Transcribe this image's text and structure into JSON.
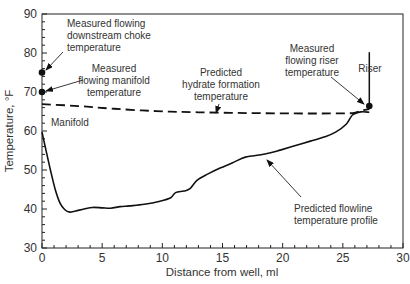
{
  "chart_data": {
    "type": "line",
    "title": "",
    "xlabel": "Distance from well, ml",
    "ylabel": "Temperature, °F",
    "xlim": [
      0,
      30
    ],
    "ylim": [
      30,
      90
    ],
    "xticks": [
      0,
      5,
      10,
      15,
      20,
      25,
      30
    ],
    "yticks": [
      30,
      40,
      50,
      60,
      70,
      80,
      90
    ],
    "grid": false,
    "legend": null,
    "series": [
      {
        "name": "Predicted flowline temperature profile",
        "style": "solid",
        "color": "#111111",
        "x": [
          0,
          0.3,
          0.7,
          1.1,
          1.5,
          1.9,
          2.3,
          2.8,
          3.5,
          4.2,
          5.0,
          5.7,
          6.5,
          7.3,
          8.5,
          9.8,
          10.7,
          11.1,
          11.8,
          12.3,
          12.9,
          13.8,
          14.8,
          15.8,
          16.9,
          18.2,
          19.0,
          19.8,
          21.0,
          22.3,
          23.5,
          24.4,
          25.3,
          25.8,
          26.5,
          27.2
        ],
        "y": [
          59.7,
          55.5,
          50.0,
          45.0,
          41.5,
          39.8,
          39.2,
          39.5,
          40.0,
          40.4,
          40.3,
          40.2,
          40.6,
          40.8,
          41.2,
          42.0,
          42.9,
          44.2,
          44.6,
          45.2,
          47.4,
          49.0,
          50.5,
          51.8,
          53.3,
          53.9,
          54.4,
          55.1,
          56.2,
          57.4,
          58.5,
          59.7,
          61.8,
          64.1,
          64.9,
          64.8
        ]
      },
      {
        "name": "Predicted hydrate formation temperature",
        "style": "dashed",
        "color": "#111111",
        "x": [
          0,
          3,
          6,
          9.5,
          13,
          17,
          21,
          24,
          25.8,
          26.5,
          27.2
        ],
        "y": [
          66.9,
          66.4,
          65.7,
          65.1,
          64.8,
          64.6,
          64.5,
          64.5,
          64.6,
          65.2,
          65.6
        ]
      }
    ],
    "points": [
      {
        "name": "Measured flowing downstream choke temperature",
        "x": 0,
        "y": 75
      },
      {
        "name": "Measured flowing manifold temperature",
        "x": 0,
        "y": 70
      },
      {
        "name": "Measured flowing riser temperature",
        "x": 27.2,
        "y": 66.4
      }
    ],
    "annotations": [
      {
        "id": "choke",
        "lines": [
          "Measured flowing",
          "downstream choke",
          "temperature"
        ],
        "align": "start",
        "tx": 67,
        "ty": 27,
        "arrow": {
          "from": [
            63,
            52
          ],
          "to": [
            46,
            70
          ]
        }
      },
      {
        "id": "manifold",
        "lines": [
          "Measured",
          "flowing manifold",
          "temperature"
        ],
        "align": "middle",
        "tx": 114,
        "ty": 72,
        "arrow": {
          "from": [
            83,
            80
          ],
          "to": [
            46,
            91
          ]
        }
      },
      {
        "id": "hydrate",
        "lines": [
          "Predicted",
          "hydrate formation",
          "temperature"
        ],
        "align": "middle",
        "tx": 221,
        "ty": 76,
        "arrow": {
          "from": [
            219,
            104
          ],
          "to": [
            216,
            113
          ]
        }
      },
      {
        "id": "riser-temp",
        "lines": [
          "Measured",
          "flowing riser",
          "temperature"
        ],
        "align": "middle",
        "tx": 312,
        "ty": 52,
        "arrow": {
          "from": [
            331,
            77
          ],
          "to": [
            364,
            104
          ]
        }
      },
      {
        "id": "riser",
        "lines": [
          "Riser"
        ],
        "align": "middle",
        "tx": 370,
        "ty": 72,
        "arrow": null
      },
      {
        "id": "manifold-label",
        "lines": [
          "Manifold"
        ],
        "align": "start",
        "tx": 51,
        "ty": 126,
        "arrow": null
      },
      {
        "id": "flowline",
        "lines": [
          "Predicted flowline",
          "temperature profile"
        ],
        "align": "start",
        "tx": 294,
        "ty": 212,
        "arrow": {
          "from": [
            301,
            197
          ],
          "to": [
            267,
            160
          ]
        }
      }
    ],
    "riser_marker": {
      "x": 27.2,
      "y_top": 80.2,
      "y_bottom": 66.4
    }
  }
}
